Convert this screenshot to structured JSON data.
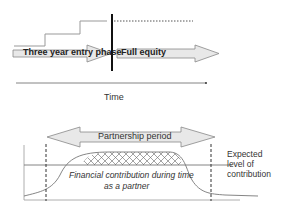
{
  "top_diagram": {
    "entry_phase_label": "Three year entry phase",
    "full_equity_label": "Full equity",
    "axis_label": "Time"
  },
  "bottom_diagram": {
    "period_label": "Partnership period",
    "curve_label_line1": "Financial contribution during time",
    "curve_label_line2": "as a partner",
    "expected_label_line1": "Expected",
    "expected_label_line2": "level of",
    "expected_label_line3": "contribution"
  },
  "colors": {
    "arrow_fill": "#e6e6e6",
    "line": "#808080",
    "bar": "#111111"
  }
}
